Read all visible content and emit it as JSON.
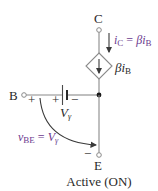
{
  "diagram": {
    "title": "Active (ON)",
    "terminals": {
      "collector": "C",
      "base": "B",
      "emitter": "E"
    },
    "collector_current": {
      "var": "i",
      "sub": "C",
      "eq": " = ",
      "beta": "β",
      "var2": "i",
      "sub2": "B"
    },
    "dependent_source": {
      "beta": "β",
      "var": "i",
      "sub": "B"
    },
    "battery": {
      "label_var": "V",
      "label_sub": "γ",
      "plus": "+",
      "minus": "−"
    },
    "vbe": {
      "var": "v",
      "sub": "BE",
      "eq": " = ",
      "rhs_var": "V",
      "rhs_sub": "γ",
      "plus": "+",
      "minus": "−"
    },
    "colors": {
      "accent": "#6b3a8e",
      "wire": "#8a8a8a",
      "text": "#2a2a2a"
    }
  }
}
